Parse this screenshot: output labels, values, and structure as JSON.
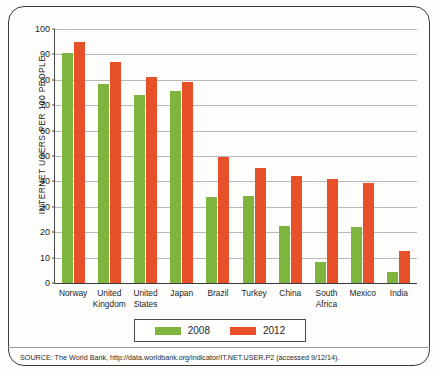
{
  "chart_data": {
    "type": "bar",
    "title": "",
    "xlabel": "",
    "ylabel": "INTERNET USERS PER 100 PEOPLE",
    "ylim": [
      0,
      100
    ],
    "yticks": [
      0,
      10,
      20,
      30,
      40,
      50,
      60,
      70,
      80,
      90,
      100
    ],
    "grid": true,
    "legend_position": "bottom",
    "categories": [
      "Norway",
      "United Kingdom",
      "United States",
      "Japan",
      "Brazil",
      "Turkey",
      "China",
      "South Africa",
      "Mexico",
      "India"
    ],
    "series": [
      {
        "name": "2008",
        "color": "#7fb53f",
        "values": [
          90.6,
          78.4,
          74.0,
          75.4,
          33.8,
          34.4,
          22.6,
          8.4,
          22.2,
          4.4
        ]
      },
      {
        "name": "2012",
        "color": "#e8502a",
        "values": [
          95.0,
          87.0,
          81.0,
          79.1,
          49.8,
          45.1,
          42.3,
          41.0,
          39.2,
          12.6
        ]
      }
    ]
  },
  "legend": {
    "items": [
      {
        "label": "2008",
        "color": "#7fb53f"
      },
      {
        "label": "2012",
        "color": "#e8502a"
      }
    ]
  },
  "source": {
    "note": "SOURCE: The World Bank, http://data.worldbank.org/indicator/IT.NET.USER.P2 (accessed 9/12/14)."
  },
  "colors": {
    "series_2008": "#7fb53f",
    "series_2012": "#e8502a",
    "gridline": "#b9b9b9",
    "axis": "#3c3c3c",
    "frame": "#3a3a3a"
  }
}
